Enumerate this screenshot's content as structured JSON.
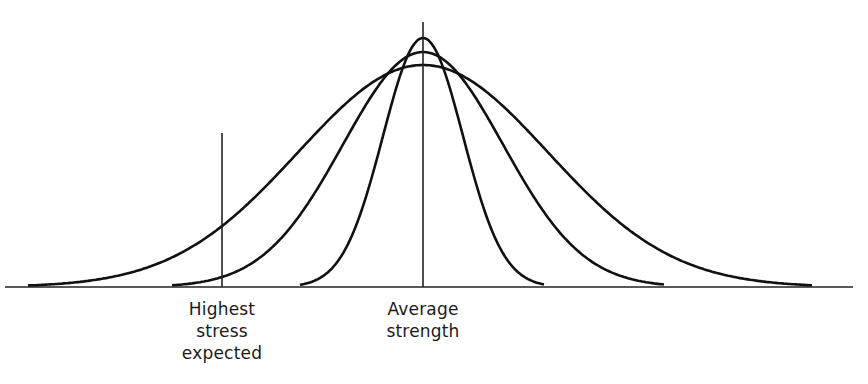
{
  "diagram": {
    "type": "overlapping normal distributions (stress vs strength)",
    "center_x": 423,
    "baseline_y": 287,
    "baseline": {
      "x1": 5,
      "x2": 853
    },
    "curves": [
      {
        "name": "narrow",
        "peak_y": 38,
        "sigma": 40,
        "x_range": [
          300,
          545
        ]
      },
      {
        "name": "medium",
        "peak_y": 52,
        "sigma": 80,
        "x_range": [
          172,
          665
        ]
      },
      {
        "name": "wide",
        "peak_y": 65,
        "sigma": 125,
        "x_range": [
          28,
          812
        ]
      }
    ],
    "stress_line": {
      "x": 222,
      "y_top": 133
    },
    "strength_line": {
      "x": 423,
      "y_top": 22
    },
    "stroke_color": "#111111"
  },
  "labels": {
    "highest_stress": "Highest\nstress\nexpected",
    "average_strength": "Average\nstrength"
  }
}
